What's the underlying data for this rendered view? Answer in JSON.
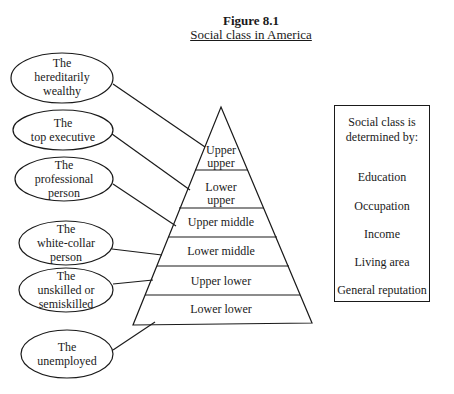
{
  "figure": {
    "number": "Figure 8.1",
    "title": "Social class in America"
  },
  "groups": [
    {
      "line1": "The",
      "line2": "hereditarily",
      "line3": "wealthy"
    },
    {
      "line1": "The",
      "line2": "top executive",
      "line3": ""
    },
    {
      "line1": "The",
      "line2": "professional",
      "line3": "person"
    },
    {
      "line1": "The",
      "line2": "white-collar",
      "line3": "person"
    },
    {
      "line1": "The",
      "line2": "unskilled or",
      "line3": "semiskilled"
    },
    {
      "line1": "The",
      "line2": "unemployed",
      "line3": ""
    }
  ],
  "pyramid_layers": [
    {
      "line1": "Upper",
      "line2": "upper"
    },
    {
      "line1": "Lower",
      "line2": "upper"
    },
    {
      "line1": "Upper middle",
      "line2": ""
    },
    {
      "line1": "Lower middle",
      "line2": ""
    },
    {
      "line1": "Upper lower",
      "line2": ""
    },
    {
      "line1": "Lower lower",
      "line2": ""
    }
  ],
  "criteria_box": {
    "heading_line1": "Social class is",
    "heading_line2": "determined by:",
    "items": [
      "Education",
      "Occupation",
      "Income",
      "Living area",
      "General reputation"
    ]
  }
}
